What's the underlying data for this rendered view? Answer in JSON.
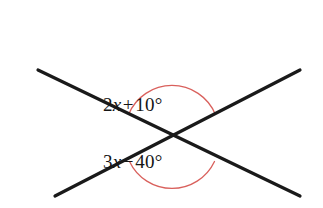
{
  "figure": {
    "type": "geometry-diagram",
    "background_color": "#ffffff",
    "width": 323,
    "height": 208
  },
  "lines": {
    "stroke_color": "#1a1a1a",
    "stroke_width": 3.2,
    "intersection": {
      "x": 172,
      "y": 137
    },
    "segments": [
      {
        "name": "line-descending",
        "x1": 38,
        "y1": 70,
        "x2": 300,
        "y2": 196
      },
      {
        "name": "line-ascending",
        "x1": 55,
        "y1": 196,
        "x2": 300,
        "y2": 70
      }
    ]
  },
  "arcs": {
    "stroke_color": "#d9605c",
    "stroke_width": 1.3,
    "radius": 47,
    "items": [
      {
        "name": "arc-upper-angle",
        "path": "M 128.6 114.4 A 47 47 0 0 1 215.4 114.4",
        "opening": "up"
      },
      {
        "name": "arc-lower-angle",
        "path": "M 129.5 161.5 A 47 47 0 0 0 214.5 161.5",
        "opening": "down"
      }
    ]
  },
  "labels": {
    "upper_angle": {
      "full_text": "2x + 10°",
      "coefficient": "2",
      "variable": "x",
      "operator": "+",
      "constant": "10°"
    },
    "lower_angle": {
      "full_text": "3x − 40°",
      "coefficient": "3",
      "variable": "x",
      "operator": "−",
      "constant": "40°"
    }
  }
}
